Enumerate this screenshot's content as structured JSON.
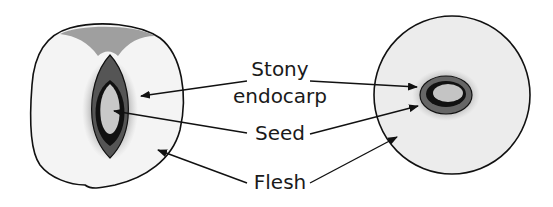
{
  "diagram": {
    "labels": {
      "stony_line1": "Stony",
      "stony_line2": "endocarp",
      "seed": "Seed",
      "flesh": "Flesh"
    },
    "figures": [
      {
        "name": "longitudinal-section",
        "parts": [
          "flesh",
          "stony endocarp",
          "seed"
        ]
      },
      {
        "name": "transverse-section",
        "parts": [
          "flesh",
          "stony endocarp",
          "seed"
        ]
      }
    ]
  }
}
